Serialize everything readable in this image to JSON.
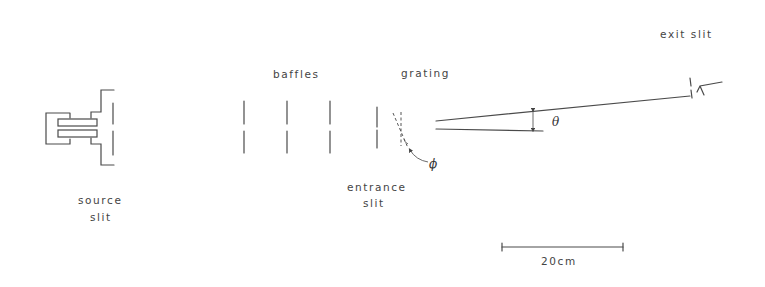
{
  "diagram": {
    "type": "spectrometer-layout",
    "colors": {
      "line": "#4a4a4a",
      "text": "#444444",
      "background": "#ffffff"
    },
    "labels": {
      "source_line1": "source",
      "source_line2": "slit",
      "baffles": "baffles",
      "grating": "grating",
      "entrance_line1": "entrance",
      "entrance_line2": "slit",
      "exit_slit": "exit slit",
      "theta": "θ",
      "phi": "ϕ",
      "scale_bar": "20cm"
    },
    "components": [
      {
        "name": "source",
        "label": "source slit"
      },
      {
        "name": "baffles",
        "count": 3
      },
      {
        "name": "entrance-slit",
        "label": "entrance slit"
      },
      {
        "name": "grating",
        "label": "grating",
        "rotation_angle": "ϕ"
      },
      {
        "name": "diffraction-angle",
        "label": "θ"
      },
      {
        "name": "exit-slit",
        "label": "exit slit"
      }
    ],
    "scale": {
      "length": 20,
      "unit": "cm"
    }
  }
}
